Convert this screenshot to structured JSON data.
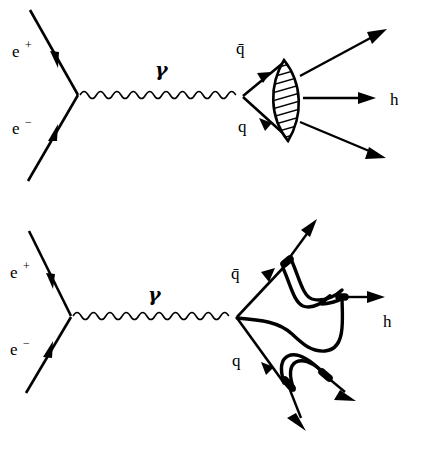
{
  "figure": {
    "background_color": "#ffffff",
    "line_color": "#000000",
    "width": 422,
    "height": 460
  },
  "diagrams": [
    {
      "id": "top",
      "name": "independent-fragmentation-blob-diagram",
      "caption": "",
      "labels": {
        "positron": "e",
        "positron_charge": "+",
        "electron": "e",
        "electron_charge": "−",
        "photon": "γ",
        "antiquark": "q̄",
        "quark": "q",
        "hadrons": "h"
      },
      "elements": {
        "blob_shape": "hatched-lens",
        "outgoing_hadron_count": 3
      }
    },
    {
      "id": "bottom",
      "name": "lund-string-fragmentation-diagram",
      "caption": "",
      "labels": {
        "positron": "e",
        "positron_charge": "+",
        "electron": "e",
        "electron_charge": "−",
        "photon": "γ",
        "antiquark": "q̄",
        "quark": "q",
        "hadrons": "h"
      },
      "elements": {
        "blob_shape": "string-loops",
        "outgoing_hadron_count": 3
      }
    }
  ]
}
